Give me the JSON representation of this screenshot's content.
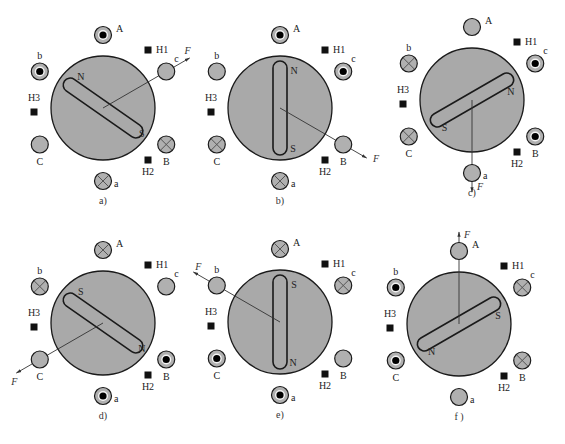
{
  "figure": {
    "coil_legend": {
      "dot": "current out of page",
      "cross": "current into page",
      "empty": "no current"
    },
    "panels": [
      {
        "caption": "a)",
        "rotor_angle_deg": 35,
        "pole_top_label": "N",
        "pole_bottom_label": "S",
        "force_label": "F",
        "force_angle_deg": -30,
        "coils": [
          {
            "name": "A",
            "state": "dot"
          },
          {
            "name": "c",
            "state": "empty"
          },
          {
            "name": "B",
            "state": "cross"
          },
          {
            "name": "a",
            "state": "cross"
          },
          {
            "name": "C",
            "state": "empty"
          },
          {
            "name": "b",
            "state": "dot"
          }
        ],
        "hall_sensors": [
          "H1",
          "H2",
          "H3"
        ]
      },
      {
        "caption": "b)",
        "rotor_angle_deg": 90,
        "pole_top_label": "N",
        "pole_bottom_label": "S",
        "force_label": "F",
        "force_angle_deg": 30,
        "coils": [
          {
            "name": "A",
            "state": "dot"
          },
          {
            "name": "c",
            "state": "dot"
          },
          {
            "name": "B",
            "state": "empty"
          },
          {
            "name": "a",
            "state": "cross"
          },
          {
            "name": "C",
            "state": "cross"
          },
          {
            "name": "b",
            "state": "empty"
          }
        ],
        "hall_sensors": [
          "H1",
          "H2",
          "H3"
        ]
      },
      {
        "caption": "c)",
        "rotor_angle_deg": -30,
        "pole_top_label": "N",
        "pole_bottom_label": "S",
        "force_label": "F",
        "force_angle_deg": 90,
        "coils": [
          {
            "name": "A",
            "state": "empty"
          },
          {
            "name": "c",
            "state": "dot"
          },
          {
            "name": "B",
            "state": "dot"
          },
          {
            "name": "a",
            "state": "empty"
          },
          {
            "name": "C",
            "state": "cross"
          },
          {
            "name": "b",
            "state": "cross"
          }
        ],
        "hall_sensors": [
          "H1",
          "H2",
          "H3"
        ]
      },
      {
        "caption": "d)",
        "rotor_angle_deg": 35,
        "pole_top_label": "S",
        "pole_bottom_label": "N",
        "force_label": "F",
        "force_angle_deg": 150,
        "coils": [
          {
            "name": "A",
            "state": "cross"
          },
          {
            "name": "c",
            "state": "empty"
          },
          {
            "name": "B",
            "state": "dot"
          },
          {
            "name": "a",
            "state": "dot"
          },
          {
            "name": "C",
            "state": "empty"
          },
          {
            "name": "b",
            "state": "cross"
          }
        ],
        "hall_sensors": [
          "H1",
          "H2",
          "H3"
        ]
      },
      {
        "caption": "e)",
        "rotor_angle_deg": 90,
        "pole_top_label": "S",
        "pole_bottom_label": "N",
        "force_label": "F",
        "force_angle_deg": -150,
        "coils": [
          {
            "name": "A",
            "state": "cross"
          },
          {
            "name": "c",
            "state": "cross"
          },
          {
            "name": "B",
            "state": "empty"
          },
          {
            "name": "a",
            "state": "dot"
          },
          {
            "name": "C",
            "state": "dot"
          },
          {
            "name": "b",
            "state": "empty"
          }
        ],
        "hall_sensors": [
          "H1",
          "H2",
          "H3"
        ]
      },
      {
        "caption": "f )",
        "rotor_angle_deg": -30,
        "pole_top_label": "S",
        "pole_bottom_label": "N",
        "force_label": "F",
        "force_angle_deg": -90,
        "coils": [
          {
            "name": "A",
            "state": "empty"
          },
          {
            "name": "c",
            "state": "cross"
          },
          {
            "name": "B",
            "state": "cross"
          },
          {
            "name": "a",
            "state": "empty"
          },
          {
            "name": "C",
            "state": "dot"
          },
          {
            "name": "b",
            "state": "dot"
          }
        ],
        "hall_sensors": [
          "H1",
          "H2",
          "H3"
        ]
      }
    ]
  },
  "colors": {
    "rotor_fill": "#a9a9a9",
    "coil_fill": "#b0b0b0",
    "outline": "#1a1a1a",
    "hall": "#111111"
  }
}
